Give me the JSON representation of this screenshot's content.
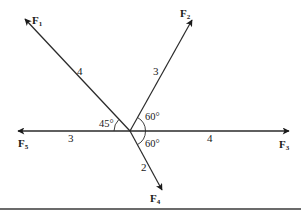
{
  "diagram": {
    "type": "force-vector-diagram",
    "colors": {
      "line": "#2a2a2a",
      "text": "#1a1a1a",
      "background": "#ffffff"
    },
    "origin": {
      "x": 130,
      "y": 131
    },
    "forces": [
      {
        "name": "F",
        "sub": "1",
        "magnitude": "4",
        "direction": "upper-left",
        "angle_label": "45°"
      },
      {
        "name": "F",
        "sub": "2",
        "magnitude": "3",
        "direction": "upper-right",
        "angle_label": "60°"
      },
      {
        "name": "F",
        "sub": "3",
        "magnitude": "4",
        "direction": "right"
      },
      {
        "name": "F",
        "sub": "4",
        "magnitude": "2",
        "direction": "lower-right",
        "angle_label": "60°"
      },
      {
        "name": "F",
        "sub": "5",
        "magnitude": "3",
        "direction": "left"
      }
    ],
    "angles": {
      "f1_to_f5": "45°",
      "f2_to_f3": "60°",
      "f3_to_f4": "60°"
    }
  }
}
